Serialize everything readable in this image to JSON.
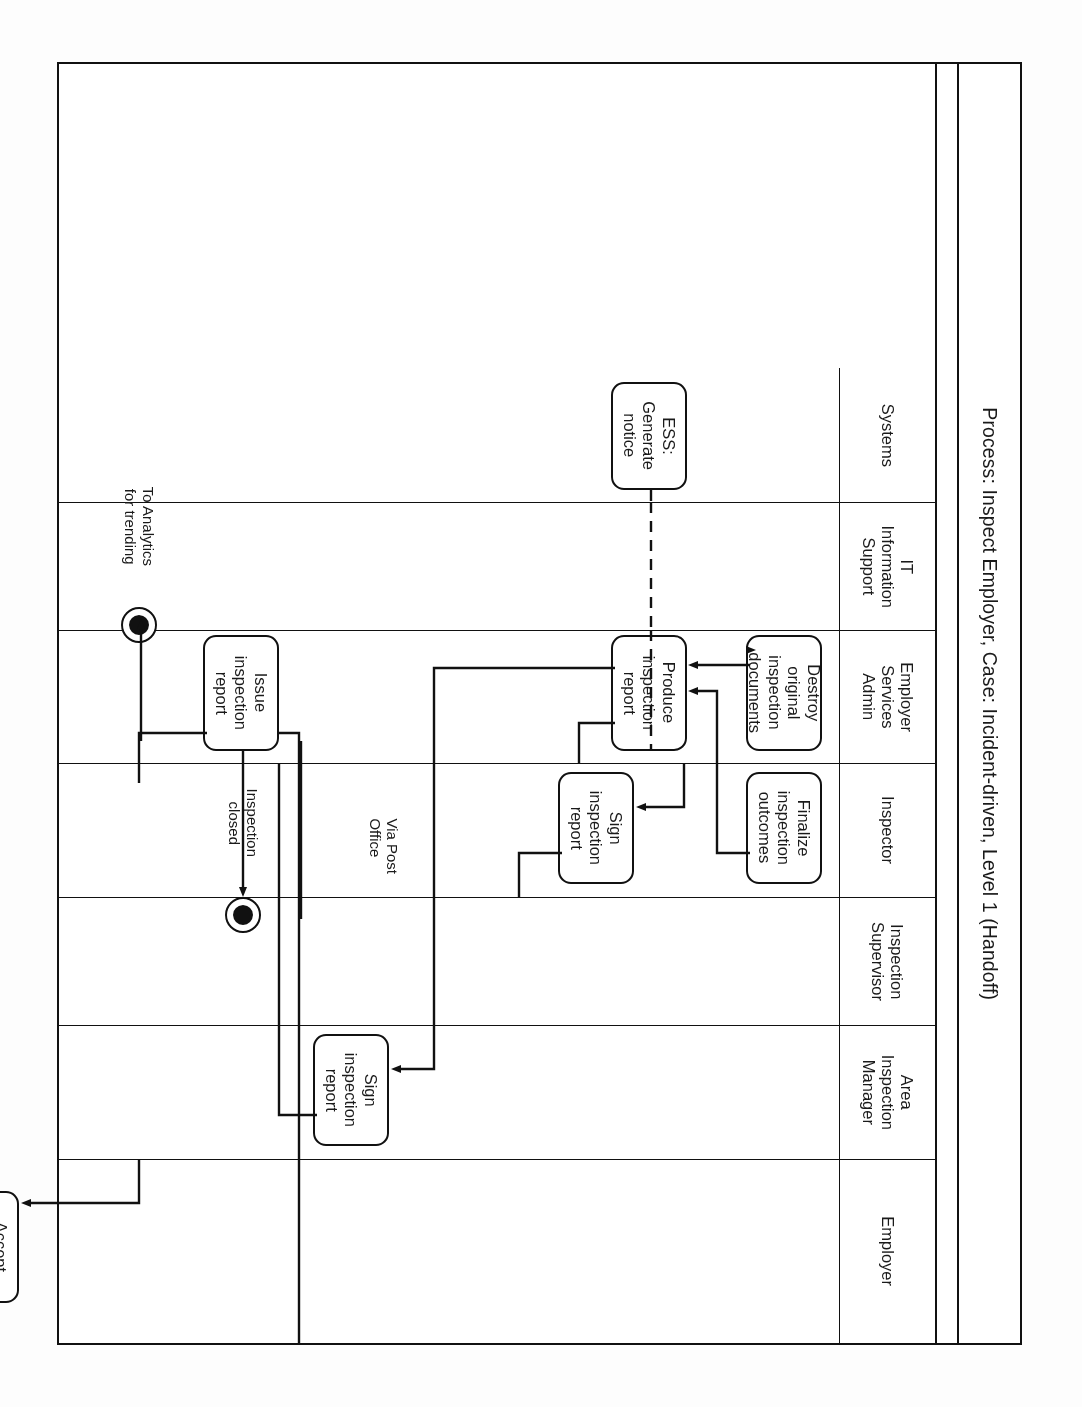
{
  "diagram": {
    "title": "Process: Inspect Employer,  Case: Incident-driven, Level 1 (Handoff)",
    "type": "bpmn-swimlane",
    "orientation": "page is rotated 180 degrees",
    "lanes": [
      {
        "id": "employer",
        "label": "Employer"
      },
      {
        "id": "area-inspection-manager",
        "label": "Area\nInspection\nManager"
      },
      {
        "id": "inspection-supervisor",
        "label": "Inspection\nSupervisor"
      },
      {
        "id": "inspector",
        "label": "Inspector"
      },
      {
        "id": "employer-services-admin",
        "label": "Employer\nServices\nAdmin"
      },
      {
        "id": "it-information-support",
        "label": "IT\nInformation\nSupport"
      },
      {
        "id": "systems",
        "label": "Systems"
      }
    ],
    "tasks": [
      {
        "id": "accept-inspection-outcomes",
        "label": "Accept\ninspection\noutcomes",
        "lane": "employer"
      },
      {
        "id": "sign-inspection-report-manager",
        "label": "Sign\ninspection\nreport",
        "lane": "area-inspection-manager"
      },
      {
        "id": "sign-inspection-report-inspector",
        "label": "Sign\ninspection\nreport",
        "lane": "inspector"
      },
      {
        "id": "finalize-inspection-outcomes",
        "label": "Finalize\ninspection\noutcomes",
        "lane": "inspector"
      },
      {
        "id": "issue-inspection-report",
        "label": "Issue\ninspection\nreport",
        "lane": "employer-services-admin"
      },
      {
        "id": "produce-inspection-report",
        "label": "Produce\ninspection\nreport",
        "lane": "employer-services-admin"
      },
      {
        "id": "destroy-original-inspection-documents",
        "label": "Destroy\noriginal\ninspection\ndocuments",
        "lane": "employer-services-admin"
      },
      {
        "id": "ess-generate-notice",
        "label": "ESS:\nGenerate\nnotice",
        "lane": "systems"
      }
    ],
    "end_events": [
      {
        "id": "to-conduct-appeal",
        "label": "To Conduct\nAppeal",
        "lane": "employer"
      },
      {
        "id": "optional-to-settle-employer-account",
        "label": "Optional to Settle\nEmployer Account",
        "lane": "employer"
      },
      {
        "id": "inspection-closed",
        "label": "Inspection\nclosed",
        "lane": "employer-services-admin"
      },
      {
        "id": "to-analytics-for-trending",
        "label": "To Analytics\nfor trending",
        "lane": "it-information-support"
      }
    ],
    "flow_labels": [
      {
        "id": "flow-no",
        "label": "No"
      },
      {
        "id": "flow-yes",
        "label": "Yes"
      },
      {
        "id": "flow-via-post-office",
        "label": "Via Post\nOffice"
      }
    ],
    "colors": {
      "stroke": "#111111",
      "background": "#ffffff"
    }
  }
}
